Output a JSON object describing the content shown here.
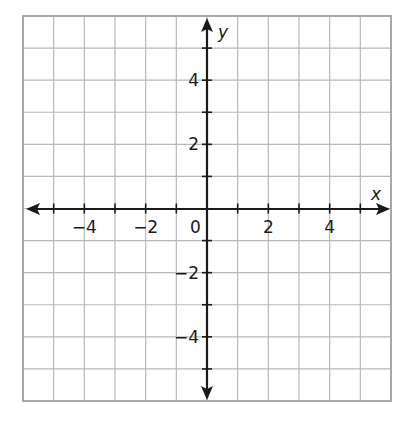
{
  "graph": {
    "type": "coordinate-plane",
    "x_axis": {
      "label": "x",
      "min": -6,
      "max": 6,
      "tick_labels": [
        {
          "value": -4,
          "text": "−4"
        },
        {
          "value": -2,
          "text": "−2"
        },
        {
          "value": 2,
          "text": "2"
        },
        {
          "value": 4,
          "text": "4"
        }
      ]
    },
    "y_axis": {
      "label": "y",
      "min": -6,
      "max": 6,
      "tick_labels": [
        {
          "value": 4,
          "text": "4"
        },
        {
          "value": 2,
          "text": "2"
        },
        {
          "value": -2,
          "text": "−2"
        },
        {
          "value": -4,
          "text": "−4"
        }
      ]
    },
    "origin_label": "0",
    "grid_step": 1,
    "colors": {
      "grid": "#b8b8b8",
      "border": "#a8a8a8",
      "axis": "#1a1a1a"
    }
  }
}
